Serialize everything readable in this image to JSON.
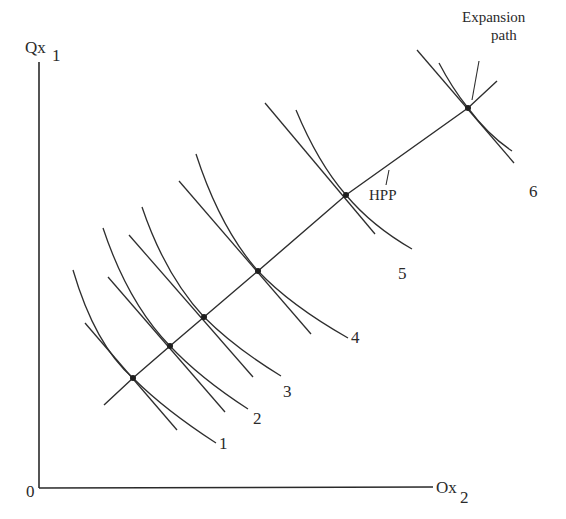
{
  "diagram": {
    "axes": {
      "y_label": "Qx",
      "y_subscript": "1",
      "x_label": "Ox",
      "x_subscript": "2",
      "origin_label": "0"
    },
    "annotations": {
      "expansion_path_line1": "Expansion",
      "expansion_path_line2": "path",
      "hpp": "HPP"
    },
    "isoquant_labels": [
      "1",
      "2",
      "3",
      "4",
      "5",
      "6"
    ],
    "tangency_points": [
      {
        "id": 1,
        "x": 133,
        "y": 378
      },
      {
        "id": 2,
        "x": 170,
        "y": 346
      },
      {
        "id": 3,
        "x": 204,
        "y": 317
      },
      {
        "id": 4,
        "x": 258,
        "y": 271
      },
      {
        "id": 5,
        "x": 346,
        "y": 195
      },
      {
        "id": 6,
        "x": 468,
        "y": 108
      }
    ],
    "line_color": "#2e2e2e",
    "background": "#ffffff"
  }
}
